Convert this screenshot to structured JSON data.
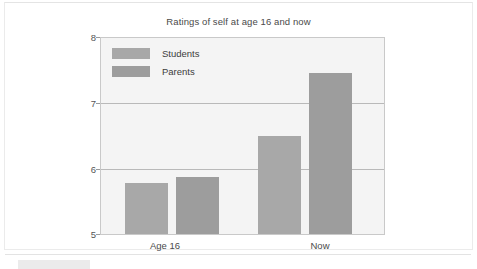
{
  "chart_data": {
    "type": "bar",
    "title": "Ratings of self at age 16 and now",
    "xlabel": "",
    "ylabel": "",
    "categories": [
      "Age 16",
      "Now"
    ],
    "series": [
      {
        "name": "Students",
        "values": [
          5.78,
          6.5
        ],
        "color": "#a8a8a8"
      },
      {
        "name": "Parents",
        "values": [
          5.88,
          7.47
        ],
        "color": "#9d9d9d"
      }
    ],
    "ylim": [
      5,
      8
    ],
    "yticks": [
      "5",
      "6",
      "7",
      "8"
    ],
    "grid": true,
    "legend_position": "top-left",
    "plot_background": "#f4f4f4",
    "gridline_color": "#b9b9b9",
    "axis_color": "#c9c9c9"
  },
  "legend": {
    "items": [
      {
        "label": "Students"
      },
      {
        "label": "Parents"
      }
    ]
  }
}
